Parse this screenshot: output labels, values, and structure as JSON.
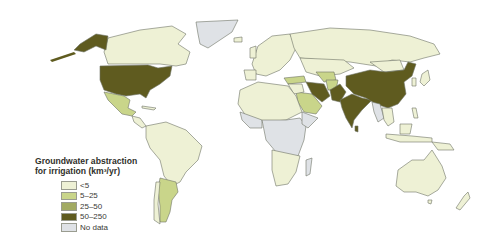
{
  "legend": {
    "title_line1": "Groundwater abstraction",
    "title_line2": "for irrigation (km³/yr)",
    "items": [
      {
        "label": "<5",
        "color": "#eef1d5"
      },
      {
        "label": "5–25",
        "color": "#c9d58a"
      },
      {
        "label": "25–50",
        "color": "#a2aa63"
      },
      {
        "label": "50–250",
        "color": "#5f5b1f"
      },
      {
        "label": "No data",
        "color": "#dfe2e6"
      }
    ]
  },
  "colors": {
    "lt5": "#eef1d5",
    "c5_25": "#c9d58a",
    "c25_50": "#a2aa63",
    "c50_250": "#5f5b1f",
    "nodata": "#dfe2e6",
    "border": "#6f7366",
    "ocean": "#ffffff"
  },
  "regions": [
    {
      "name": "United States",
      "class": "50–250"
    },
    {
      "name": "Alaska",
      "class": "50–250"
    },
    {
      "name": "China",
      "class": "50–250"
    },
    {
      "name": "India",
      "class": "50–250"
    },
    {
      "name": "Pakistan",
      "class": "50–250"
    },
    {
      "name": "Iran",
      "class": "50–250"
    },
    {
      "name": "Mexico",
      "class": "5–25"
    },
    {
      "name": "Argentina",
      "class": "5–25"
    },
    {
      "name": "Saudi Arabia",
      "class": "5–25"
    },
    {
      "name": "Turkey",
      "class": "5–25"
    },
    {
      "name": "Uzbekistan",
      "class": "5–25"
    },
    {
      "name": "Afghanistan",
      "class": "5–25"
    },
    {
      "name": "Canada",
      "class": "<5"
    },
    {
      "name": "Brazil",
      "class": "<5"
    },
    {
      "name": "Russia",
      "class": "<5"
    },
    {
      "name": "Australia",
      "class": "<5"
    },
    {
      "name": "Greenland",
      "class": "No data"
    },
    {
      "name": "Central Africa",
      "class": "No data"
    }
  ]
}
